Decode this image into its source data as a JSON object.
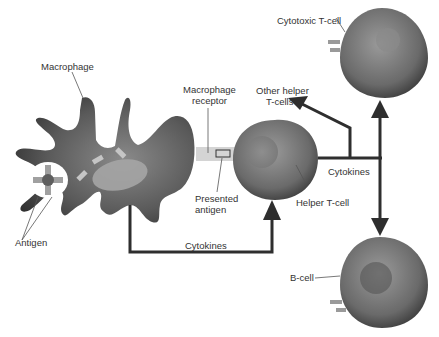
{
  "diagram": {
    "type": "immune-response-flow",
    "colors": {
      "cell_dark": "#3a3a3a",
      "cell_mid": "#7a7a7a",
      "cell_light": "#a8a8a8",
      "nucleus": "#8c8c8c",
      "arrow": "#2e2e2e",
      "receptor_band": "#d4d4d4",
      "text": "#333333"
    },
    "nodes": [
      {
        "id": "macrophage",
        "label": "Macrophage"
      },
      {
        "id": "antigen",
        "label": "Antigen"
      },
      {
        "id": "macrophage_receptor",
        "label": "Macrophage receptor"
      },
      {
        "id": "presented_antigen",
        "label": "Presented antigen"
      },
      {
        "id": "helper_tcell",
        "label": "Helper T-cell"
      },
      {
        "id": "other_helper_tcells",
        "label": "Other helper T-cells"
      },
      {
        "id": "cytotoxic_tcell",
        "label": "Cytotoxic T-cell"
      },
      {
        "id": "bcell",
        "label": "B-cell"
      }
    ],
    "edges": [
      {
        "from": "macrophage",
        "to": "helper_tcell",
        "label": "Cytokines"
      },
      {
        "from": "helper_tcell",
        "to": "other_helper_tcells",
        "label": "Cytokines"
      },
      {
        "from": "helper_tcell",
        "to": "cytotoxic_tcell",
        "label": "Cytokines"
      },
      {
        "from": "helper_tcell",
        "to": "bcell",
        "label": "Cytokines"
      }
    ]
  },
  "labels": {
    "macrophage": "Macrophage",
    "macrophage_receptor_1": "Macrophage",
    "macrophage_receptor_2": "receptor",
    "other_helper_1": "Other helper",
    "other_helper_2": "T-cells",
    "cytotoxic": "Cytotoxic T-cell",
    "presented_1": "Presented",
    "presented_2": "antigen",
    "helper": "Helper T-cell",
    "cytokines_right": "Cytokines",
    "cytokines_bottom": "Cytokines",
    "antigen": "Antigen",
    "bcell": "B-cell"
  }
}
